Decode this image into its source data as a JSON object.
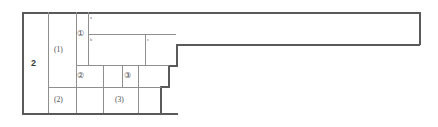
{
  "figure": {
    "type": "technical-line-diagram",
    "background": "#ffffff",
    "stroke_outer": "#5a5a5a",
    "stroke_inner": "#8f8f8f",
    "stroke_faint": "#b4b4b4",
    "text_color": "#4a4a4a",
    "width_px": 438,
    "height_px": 127
  },
  "labels": {
    "level_outer": "2",
    "group_1": "(1)",
    "group_2": "(2)",
    "group_3": "(3)",
    "circled_1": "①",
    "circled_2": "②",
    "circled_3": "③",
    "sub_a": "a",
    "sub_b": "b",
    "sub_c": "c"
  }
}
